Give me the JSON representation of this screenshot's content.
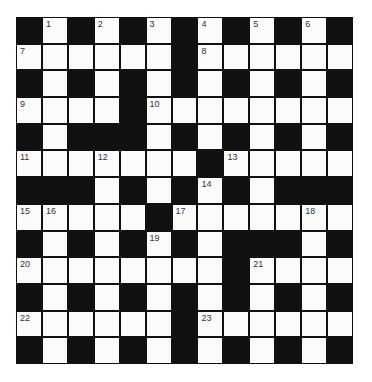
{
  "puzzle": {
    "rows": 13,
    "cols": 13,
    "colors": {
      "block": "#111111",
      "cell": "#fbfbfb",
      "number": "#333333"
    },
    "layout": [
      "#1#2#3#4#5#6#",
      "......#......",
      "#.#.#.#.#.#.#",
      "....#........",
      "#.###.#.#.#.#",
      ".......#.....",
      "###.#.#.#.###",
      ".....#.......",
      "#.#.#.#.###.#",
      "........#....",
      "#.#.#.#.#.#.#",
      "......#......",
      "#.#.#.#.#.#.#"
    ],
    "numbers": [
      {
        "r": 0,
        "c": 1,
        "n": "1"
      },
      {
        "r": 0,
        "c": 3,
        "n": "2"
      },
      {
        "r": 0,
        "c": 5,
        "n": "3"
      },
      {
        "r": 0,
        "c": 7,
        "n": "4"
      },
      {
        "r": 0,
        "c": 9,
        "n": "5"
      },
      {
        "r": 0,
        "c": 11,
        "n": "6"
      },
      {
        "r": 1,
        "c": 0,
        "n": "7"
      },
      {
        "r": 1,
        "c": 7,
        "n": "8"
      },
      {
        "r": 3,
        "c": 0,
        "n": "9"
      },
      {
        "r": 3,
        "c": 5,
        "n": "10"
      },
      {
        "r": 5,
        "c": 0,
        "n": "11"
      },
      {
        "r": 5,
        "c": 3,
        "n": "12"
      },
      {
        "r": 5,
        "c": 8,
        "n": "13"
      },
      {
        "r": 6,
        "c": 7,
        "n": "14"
      },
      {
        "r": 7,
        "c": 0,
        "n": "15"
      },
      {
        "r": 7,
        "c": 1,
        "n": "16"
      },
      {
        "r": 7,
        "c": 6,
        "n": "17"
      },
      {
        "r": 7,
        "c": 11,
        "n": "18"
      },
      {
        "r": 8,
        "c": 5,
        "n": "19"
      },
      {
        "r": 9,
        "c": 0,
        "n": "20"
      },
      {
        "r": 9,
        "c": 9,
        "n": "21"
      },
      {
        "r": 11,
        "c": 0,
        "n": "22"
      },
      {
        "r": 11,
        "c": 7,
        "n": "23"
      }
    ]
  }
}
